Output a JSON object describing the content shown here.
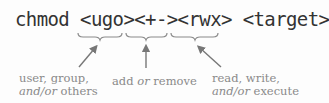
{
  "command": {
    "program": "chmod",
    "ugo": "<ugo>",
    "op": "<+->",
    "perms": "<rwx>",
    "target": "<target>"
  },
  "annotations": {
    "ugo": {
      "line1": "user, group,",
      "line2_italic": "and/or",
      "line2_rest": " others"
    },
    "op": {
      "pre": "add ",
      "italic": "or",
      "post": " remove"
    },
    "perms": {
      "line1": "read, write,",
      "line2_italic": "and/or",
      "line2_rest": " execute"
    }
  },
  "colors": {
    "command_text": "#333333",
    "annotation_text": "#8a8a8a",
    "brace": "#8a8a8a",
    "arrow": "#777777",
    "background": "#fdfdfd"
  }
}
